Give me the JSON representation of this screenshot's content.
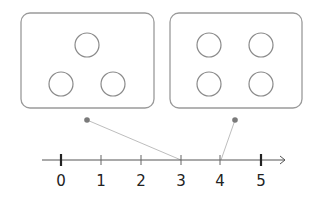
{
  "diagram": {
    "boxes": [
      {
        "name": "left-box",
        "count": 3,
        "circles": [
          [
            87,
            45
          ],
          [
            65,
            83
          ],
          [
            109,
            83
          ]
        ],
        "dot": [
          87,
          120
        ]
      },
      {
        "name": "right-box",
        "count": 4,
        "circles": [
          [
            209,
            45
          ],
          [
            257,
            45
          ],
          [
            209,
            83
          ],
          [
            257,
            83
          ]
        ],
        "dot": [
          235,
          120
        ]
      }
    ],
    "number_line": {
      "ticks": [
        {
          "value": "0",
          "x": 61,
          "major": true
        },
        {
          "value": "1",
          "x": 101,
          "major": false
        },
        {
          "value": "2",
          "x": 141,
          "major": false
        },
        {
          "value": "3",
          "x": 181,
          "major": false
        },
        {
          "value": "4",
          "x": 220,
          "major": false
        },
        {
          "value": "5",
          "x": 261,
          "major": true
        }
      ]
    },
    "connectors": [
      {
        "from": "left-box",
        "to_value": "3"
      },
      {
        "from": "right-box",
        "to_value": "4"
      }
    ],
    "colors": {
      "box_stroke": "#9a9a9a",
      "circle_stroke": "#8a8a8a",
      "line": "#555555",
      "dot": "#7a7a7a",
      "connector": "#b5b5b5"
    }
  }
}
